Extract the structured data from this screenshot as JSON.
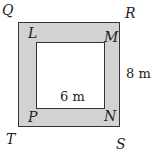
{
  "diagram": {
    "outer_vertices": {
      "top_left": "Q",
      "top_right": "R",
      "bottom_right": "S",
      "bottom_left": "T"
    },
    "inner_vertices": {
      "top_left": "L",
      "top_right": "M",
      "bottom_right": "N",
      "bottom_left": "P"
    },
    "dimensions": {
      "inner_width": "6 m",
      "border_width": "8 m"
    },
    "colors": {
      "border_fill": "#d3d3d3",
      "inner_fill": "#ffffff",
      "stroke": "#333333"
    }
  }
}
